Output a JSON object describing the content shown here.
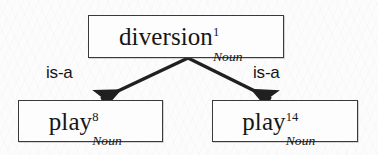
{
  "figure": {
    "type": "graph",
    "background_color": "#fcfcfc",
    "stroke_color": "#3a3a3a",
    "text_color": "#161616"
  },
  "nodes": [
    {
      "id": "diversion-1-noun",
      "role": "root",
      "base": "diversion",
      "superscript": "1",
      "subscript": "Noun"
    },
    {
      "id": "play-8-noun",
      "role": "leaf-left",
      "base": "play",
      "superscript": "8",
      "subscript": "Noun"
    },
    {
      "id": "play-14-noun",
      "role": "leaf-right",
      "base": "play",
      "superscript": "14",
      "subscript": "Noun"
    }
  ],
  "edges": [
    {
      "id": "edge-left",
      "label": "is-a",
      "from": "diversion-1-noun",
      "to": "play-8-noun"
    },
    {
      "id": "edge-right",
      "label": "is-a",
      "from": "diversion-1-noun",
      "to": "play-14-noun"
    }
  ]
}
